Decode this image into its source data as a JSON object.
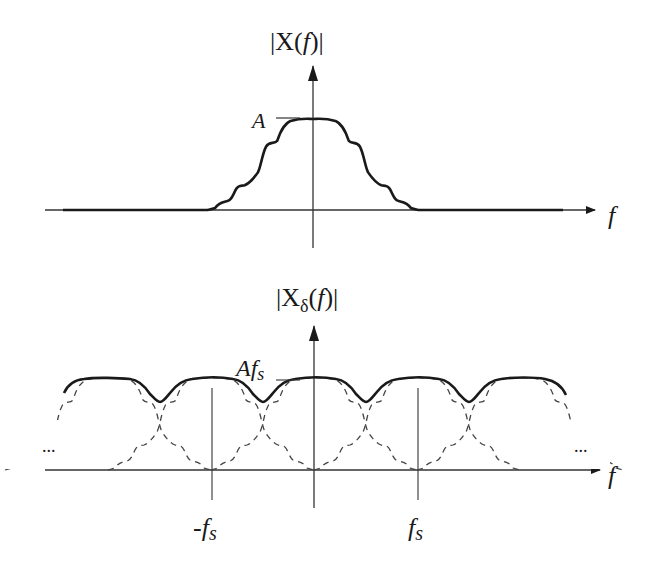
{
  "diagram": {
    "top": {
      "title_prefix": "|X(",
      "title_var": "f",
      "title_suffix": ")|",
      "peak_label": "A",
      "x_axis_label": "f"
    },
    "bottom": {
      "title_prefix": "|X",
      "title_sub": "δ",
      "title_open": "(",
      "title_var": "f",
      "title_suffix": ")|",
      "peak_label_main": "Af",
      "peak_label_sub": "s",
      "x_axis_label": "f",
      "left_ellipsis": "...",
      "right_ellipsis": "...",
      "tick_neg_prefix": "-f",
      "tick_neg_sub": "s",
      "tick_pos": "f",
      "tick_pos_sub": "s"
    },
    "colors": {
      "line": "#1a1a1a",
      "axis": "#333333",
      "dashed": "#444444"
    }
  }
}
